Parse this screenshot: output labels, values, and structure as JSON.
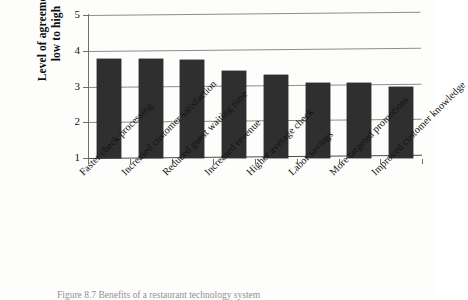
{
  "figure": {
    "caption": "Figure 8.7   Benefits of a restaurant technology system"
  },
  "chart_data": {
    "type": "bar",
    "title": "",
    "xlabel": "",
    "ylabel": "Level of agreement low to high",
    "ylabel_lines": [
      "Level of agreement",
      "low to high"
    ],
    "ylim": [
      1,
      5
    ],
    "yticks": [
      1,
      2,
      3,
      4,
      5
    ],
    "ytick_labels": [
      "1",
      "2",
      "3",
      "4",
      "5"
    ],
    "grid": true,
    "legend": null,
    "bar_color": "#2f2f2f",
    "categories": [
      "Faster check processing",
      "Increased customer satisfaction",
      "Reduced guest waiting time",
      "Increased revenue",
      "Higher average check",
      "Labor savings",
      "More targeted promotions",
      "Improved customer knowledge"
    ],
    "values": [
      3.78,
      3.77,
      3.75,
      3.44,
      3.32,
      3.11,
      3.09,
      3.0
    ]
  }
}
